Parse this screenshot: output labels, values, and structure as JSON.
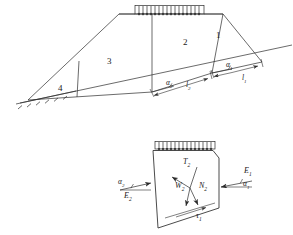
{
  "figure": {
    "type": "geotechnical-slope-stability-diagram",
    "stroke_color": "#2b2b2b",
    "background": "#ffffff"
  },
  "upper_diagram": {
    "name": "slope-wedge-section",
    "surcharge_load": {
      "label": "distributed-load",
      "tick_count": 17
    },
    "wedges": [
      {
        "id": "1",
        "label": "1"
      },
      {
        "id": "2",
        "label": "2"
      },
      {
        "id": "3",
        "label": "3"
      },
      {
        "id": "4",
        "label": "4"
      }
    ],
    "angles": [
      {
        "name": "alpha-1",
        "symbol": "α",
        "sub": "1"
      },
      {
        "name": "alpha-2",
        "symbol": "α",
        "sub": "2"
      }
    ],
    "lengths": [
      {
        "name": "l-1",
        "symbol": "l",
        "sub": "1"
      },
      {
        "name": "l-2",
        "symbol": "l",
        "sub": "2"
      }
    ],
    "ground_hatch": {
      "label": "ground-surface-hatching",
      "tick_count": 7
    }
  },
  "lower_diagram": {
    "name": "free-body-diagram-wedge-2",
    "surcharge_load": {
      "label": "distributed-load",
      "tick_count": 15
    },
    "forces": [
      {
        "name": "T2",
        "symbol": "T",
        "sub": "2"
      },
      {
        "name": "W2",
        "symbol": "W",
        "sub": "2"
      },
      {
        "name": "N2",
        "symbol": "N",
        "sub": "2"
      },
      {
        "name": "E1",
        "symbol": "E",
        "sub": "1"
      },
      {
        "name": "E2",
        "symbol": "E",
        "sub": "2"
      },
      {
        "name": "tau1",
        "symbol": "τ",
        "sub": "1"
      }
    ],
    "angles": [
      {
        "name": "alpha-1",
        "symbol": "α",
        "sub": "1"
      },
      {
        "name": "alpha-2",
        "symbol": "α",
        "sub": "2"
      }
    ]
  },
  "labels": {
    "w1": "1",
    "w2": "2",
    "w3": "3",
    "w4": "4",
    "a1_top": "α",
    "a1_top_sub": "1",
    "a2_top": "α",
    "a2_top_sub": "2",
    "l1": "l",
    "l1_sub": "1",
    "l2": "l",
    "l2_sub": "2",
    "T2": "T",
    "T2_sub": "2",
    "W2": "W",
    "W2_sub": "2",
    "N2": "N",
    "N2_sub": "2",
    "E1": "E",
    "E1_sub": "1",
    "E2": "E",
    "E2_sub": "2",
    "tau1": "τ",
    "tau1_sub": "1",
    "a1_bot": "α",
    "a1_bot_sub": "1",
    "a2_bot": "α",
    "a2_bot_sub": "2"
  }
}
